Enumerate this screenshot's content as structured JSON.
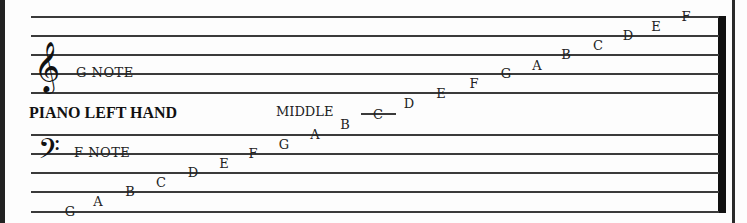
{
  "diagram": {
    "title": "PIANO LEFT HAND",
    "treble": {
      "clef_icon": "treble-clef-icon",
      "clef_glyph": "𝄞",
      "note_label": "G NOTE",
      "line_y": [
        16,
        35,
        54,
        73,
        92
      ]
    },
    "bass": {
      "clef_icon": "bass-clef-icon",
      "clef_glyph": "𝄢",
      "note_label": "F NOTE",
      "line_y": [
        134,
        153,
        172,
        191,
        211
      ]
    },
    "middle_c": {
      "label": "MIDDLE",
      "note": "C"
    },
    "notes": [
      {
        "name": "G",
        "x": 70,
        "y": 211
      },
      {
        "name": "A",
        "x": 98,
        "y": 201
      },
      {
        "name": "B",
        "x": 130,
        "y": 191
      },
      {
        "name": "C",
        "x": 161,
        "y": 182
      },
      {
        "name": "D",
        "x": 193,
        "y": 172
      },
      {
        "name": "E",
        "x": 224,
        "y": 163
      },
      {
        "name": "F",
        "x": 253,
        "y": 153
      },
      {
        "name": "G",
        "x": 284,
        "y": 144
      },
      {
        "name": "A",
        "x": 315,
        "y": 134
      },
      {
        "name": "B",
        "x": 345,
        "y": 124
      },
      {
        "name": "D",
        "x": 409,
        "y": 103
      },
      {
        "name": "E",
        "x": 441,
        "y": 93
      },
      {
        "name": "F",
        "x": 474,
        "y": 83
      },
      {
        "name": "G",
        "x": 506,
        "y": 73
      },
      {
        "name": "A",
        "x": 537,
        "y": 65
      },
      {
        "name": "B",
        "x": 566,
        "y": 54
      },
      {
        "name": "C",
        "x": 598,
        "y": 45
      },
      {
        "name": "D",
        "x": 628,
        "y": 35
      },
      {
        "name": "E",
        "x": 656,
        "y": 26
      },
      {
        "name": "F",
        "x": 686,
        "y": 16
      }
    ]
  }
}
